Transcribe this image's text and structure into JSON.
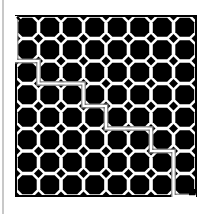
{
  "puzzle": {
    "type": "maze",
    "rows": 8,
    "cols": 8,
    "start": {
      "row": 0,
      "col": 0,
      "marker": "arrow-down-right"
    },
    "end": {
      "row": 8,
      "col": 8,
      "marker": "arrow-down-right"
    },
    "colors": {
      "wall": "#000000",
      "background": "#ffffff",
      "path": "#8a8a8a",
      "divider": "#c8c8c8"
    },
    "route": [
      [
        0,
        0
      ],
      [
        1,
        0
      ],
      [
        2,
        0
      ],
      [
        2,
        1
      ],
      [
        3,
        1
      ],
      [
        3,
        2
      ],
      [
        3,
        3
      ],
      [
        4,
        3
      ],
      [
        4,
        4
      ],
      [
        5,
        4
      ],
      [
        5,
        5
      ],
      [
        5,
        6
      ],
      [
        6,
        6
      ],
      [
        6,
        7
      ],
      [
        7,
        7
      ],
      [
        8,
        7
      ],
      [
        8,
        8
      ]
    ]
  }
}
